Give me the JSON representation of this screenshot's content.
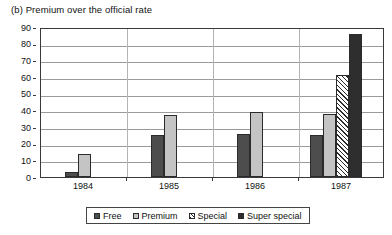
{
  "chart_data": {
    "type": "bar",
    "title": "(b) Premium over the official rate",
    "xlabel": "",
    "ylabel": "",
    "ylim": [
      0,
      90
    ],
    "ytick_step": 10,
    "yticks": [
      "0",
      "10",
      "20",
      "30",
      "40",
      "50",
      "60",
      "70",
      "80",
      "90"
    ],
    "grid": true,
    "legend_position": "bottom",
    "categories": [
      "1984",
      "1985",
      "1986",
      "1987"
    ],
    "series": [
      {
        "name": "Free",
        "values": [
          3,
          25,
          26,
          25
        ],
        "color": "#4d4d4d",
        "pattern": "solid"
      },
      {
        "name": "Premium",
        "values": [
          14,
          37,
          39,
          38
        ],
        "color": "#c4c4c4",
        "pattern": "solid"
      },
      {
        "name": "Special",
        "values": [
          null,
          null,
          null,
          61
        ],
        "color": "#ffffff",
        "pattern": "diagonal-hatch"
      },
      {
        "name": "Super special",
        "values": [
          null,
          null,
          null,
          86
        ],
        "color": "#2e2e2e",
        "pattern": "solid"
      }
    ]
  }
}
